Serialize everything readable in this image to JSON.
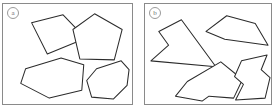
{
  "figure": {
    "background_color": "#ffffff",
    "stroke_color": "#2b2b2b",
    "frame_color": "#8a8a8a",
    "label_color": "#6f6f6f"
  },
  "panels": [
    {
      "id": "panel-a",
      "label": "a",
      "caption": "convex polygons",
      "shapes": [
        {
          "name": "convex-quadrilateral",
          "kind": "convex",
          "sides": 4,
          "points": "29,19 61,11 84,35 45,51"
        },
        {
          "name": "convex-pentagon",
          "kind": "convex",
          "sides": 5,
          "points": "93,10 121,26 113,57 78,56 71,26"
        },
        {
          "name": "convex-hexagon-left",
          "kind": "convex",
          "sides": 6,
          "points": "23,66 59,55 82,62 80,88 47,96 18,81"
        },
        {
          "name": "convex-heptagon-right",
          "kind": "convex",
          "sides": 7,
          "points": "95,66 120,58 128,67 126,83 112,97 90,95 85,78"
        }
      ]
    },
    {
      "id": "panel-b",
      "label": "b",
      "caption": "concave (non-convex) polygons",
      "shapes": [
        {
          "name": "concave-arrow-star",
          "kind": "concave",
          "sides": 5,
          "points": "37,16 72,64 6,58 24,42 14,28"
        },
        {
          "name": "concave-dart-right",
          "kind": "concave",
          "sides": 5,
          "points": "83,12 112,20 125,42 81,36 62,28"
        },
        {
          "name": "concave-notched-pentagon",
          "kind": "concave",
          "sides": 6,
          "points": "43,79 77,59 99,77 90,96 65,94 58,99 31,94"
        },
        {
          "name": "concave-hourglass",
          "kind": "concave",
          "sides": 8,
          "points": "98,58 124,52 118,67 127,75 122,96 92,98 100,82 91,74"
        }
      ]
    }
  ]
}
